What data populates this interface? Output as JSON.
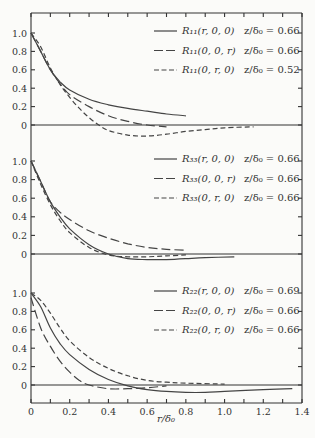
{
  "chart_data": {
    "type": "line",
    "xlabel": "r/δ0",
    "x_range": [
      0,
      1.4
    ],
    "x_ticks": [
      "0",
      "0.2",
      "0.4",
      "0.6",
      "0.8",
      "1.0",
      "1.2",
      "1.4"
    ],
    "y_ticks": [
      "1.0",
      "0.8",
      "0.6",
      "0.4",
      "0.2",
      "0"
    ],
    "grid": false,
    "legend_position": "upper right (in each panel)",
    "panels": [
      {
        "id": "R11",
        "ylim": [
          -0.3,
          1.2
        ],
        "series": [
          {
            "name": "R11(r, 0, 0)",
            "condition": "z/δ0 = 0.66",
            "style": "solid",
            "x": [
              0,
              0.05,
              0.1,
              0.15,
              0.2,
              0.3,
              0.4,
              0.5,
              0.6,
              0.7,
              0.8
            ],
            "y": [
              1.0,
              0.8,
              0.6,
              0.47,
              0.38,
              0.28,
              0.22,
              0.18,
              0.15,
              0.12,
              0.1
            ]
          },
          {
            "name": "R11(0, 0, r)",
            "condition": "z/δ0 = 0.66",
            "style": "long-dash",
            "x": [
              0,
              0.05,
              0.1,
              0.15,
              0.2,
              0.3,
              0.4,
              0.5,
              0.6,
              0.7
            ],
            "y": [
              1.0,
              0.8,
              0.6,
              0.45,
              0.33,
              0.2,
              0.1,
              0.04,
              0.0,
              -0.02
            ]
          },
          {
            "name": "R11(0, r, 0)",
            "condition": "z/δ0 = 0.52",
            "style": "short-dash",
            "x": [
              0,
              0.05,
              0.1,
              0.15,
              0.2,
              0.25,
              0.3,
              0.35,
              0.4,
              0.5,
              0.6,
              0.7,
              0.8,
              0.9,
              1.0,
              1.15
            ],
            "y": [
              1.0,
              0.85,
              0.62,
              0.44,
              0.3,
              0.18,
              0.08,
              0.0,
              -0.06,
              -0.11,
              -0.12,
              -0.1,
              -0.07,
              -0.05,
              -0.03,
              -0.02
            ]
          }
        ]
      },
      {
        "id": "R33",
        "ylim": [
          -0.3,
          1.2
        ],
        "series": [
          {
            "name": "R33(r, 0, 0)",
            "condition": "z/δ0 = 0.66",
            "style": "solid",
            "x": [
              0,
              0.05,
              0.1,
              0.15,
              0.2,
              0.3,
              0.4,
              0.5,
              0.6,
              0.7,
              0.8,
              0.9,
              1.05
            ],
            "y": [
              1.0,
              0.78,
              0.56,
              0.4,
              0.27,
              0.1,
              0.0,
              -0.05,
              -0.06,
              -0.06,
              -0.05,
              -0.04,
              -0.03
            ]
          },
          {
            "name": "R33(0, 0, r)",
            "condition": "z/δ0 = 0.66",
            "style": "long-dash",
            "x": [
              0,
              0.05,
              0.1,
              0.15,
              0.2,
              0.3,
              0.4,
              0.5,
              0.6,
              0.7,
              0.8
            ],
            "y": [
              1.0,
              0.78,
              0.56,
              0.45,
              0.37,
              0.25,
              0.17,
              0.11,
              0.07,
              0.05,
              0.04
            ]
          },
          {
            "name": "R33(0, r, 0)",
            "condition": "z/δ0 = 0.66",
            "style": "short-dash",
            "x": [
              0,
              0.05,
              0.1,
              0.15,
              0.2,
              0.3,
              0.4,
              0.5,
              0.6,
              0.7,
              0.8
            ],
            "y": [
              1.0,
              0.75,
              0.53,
              0.36,
              0.23,
              0.07,
              -0.01,
              -0.03,
              -0.03,
              -0.02,
              -0.01
            ]
          }
        ]
      },
      {
        "id": "R22",
        "ylim": [
          -0.3,
          1.2
        ],
        "series": [
          {
            "name": "R22(r, 0, 0)",
            "condition": "z/δ0 = 0.69",
            "style": "solid",
            "x": [
              0,
              0.05,
              0.1,
              0.15,
              0.2,
              0.3,
              0.4,
              0.5,
              0.6,
              0.7,
              0.8,
              0.9,
              1.0,
              1.2,
              1.35
            ],
            "y": [
              1.0,
              0.85,
              0.62,
              0.45,
              0.33,
              0.17,
              0.06,
              -0.01,
              -0.05,
              -0.07,
              -0.08,
              -0.08,
              -0.07,
              -0.05,
              -0.04
            ]
          },
          {
            "name": "R22(0, 0, r)",
            "condition": "z/δ0 = 0.66",
            "style": "long-dash",
            "x": [
              0,
              0.05,
              0.1,
              0.15,
              0.2,
              0.25,
              0.3,
              0.4,
              0.5,
              0.6,
              0.7
            ],
            "y": [
              0.95,
              0.62,
              0.42,
              0.26,
              0.14,
              0.05,
              0.0,
              -0.04,
              -0.04,
              -0.03,
              -0.01
            ]
          },
          {
            "name": "R22(0, r, 0)",
            "condition": "z/δ0 = 0.66",
            "style": "short-dash",
            "x": [
              0,
              0.05,
              0.1,
              0.15,
              0.2,
              0.3,
              0.4,
              0.5,
              0.6,
              0.7,
              0.8,
              1.0
            ],
            "y": [
              1.0,
              0.92,
              0.78,
              0.62,
              0.48,
              0.3,
              0.18,
              0.1,
              0.05,
              0.03,
              0.02,
              0.01
            ]
          }
        ]
      }
    ]
  },
  "legends": [
    [
      {
        "label": "R₁₁(r, 0, 0)",
        "value": "z/δ₀ = 0.66"
      },
      {
        "label": "R₁₁(0, 0, r)",
        "value": "z/δ₀ = 0.66"
      },
      {
        "label": "R₁₁(0, r, 0)",
        "value": "z/δ₀ = 0.52"
      }
    ],
    [
      {
        "label": "R₃₃(r, 0, 0)",
        "value": "z/δ₀ = 0.66"
      },
      {
        "label": "R₃₃(0, 0, r)",
        "value": "z/δ₀ = 0.66"
      },
      {
        "label": "R₃₃(0, r, 0)",
        "value": "z/δ₀ = 0.66"
      }
    ],
    [
      {
        "label": "R₂₂(r, 0, 0)",
        "value": "z/δ₀ = 0.69"
      },
      {
        "label": "R₂₂(0, 0, r)",
        "value": "z/δ₀ = 0.66"
      },
      {
        "label": "R₂₂(0, r, 0)",
        "value": "z/δ₀ = 0.66"
      }
    ]
  ],
  "axis": {
    "x_title": "r/δ₀"
  },
  "colors": {
    "ink": "#444444",
    "background": "#fbfbf9"
  }
}
